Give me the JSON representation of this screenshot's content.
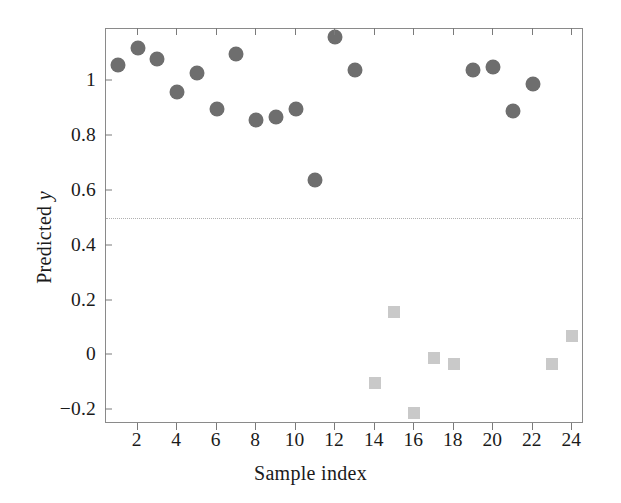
{
  "chart_data": {
    "type": "scatter",
    "title": "",
    "xlabel": "Sample index",
    "ylabel": "Predicted y",
    "xlim": [
      0.4,
      24.6
    ],
    "ylim": [
      -0.25,
      1.19
    ],
    "grid": false,
    "legend": null,
    "x_ticks": [
      2,
      4,
      6,
      8,
      10,
      12,
      14,
      16,
      18,
      20,
      22,
      24
    ],
    "x_tick_labels": [
      "2",
      "4",
      "6",
      "8",
      "10",
      "12",
      "14",
      "16",
      "18",
      "20",
      "22",
      "24"
    ],
    "y_ticks": [
      -0.2,
      0,
      0.2,
      0.4,
      0.6,
      0.8,
      1
    ],
    "y_tick_labels": [
      "−0.2",
      "0",
      "0.2",
      "0.4",
      "0.6",
      "0.8",
      "1"
    ],
    "annotations": [
      {
        "name": "threshold-line",
        "type": "hline",
        "y": 0.5,
        "style": "dotted",
        "color": "#b0b0b0"
      }
    ],
    "series": [
      {
        "name": "class-positive",
        "marker": "circle",
        "color": "#6e6e6e",
        "points": [
          {
            "x": 1,
            "y": 1.06
          },
          {
            "x": 2,
            "y": 1.12
          },
          {
            "x": 3,
            "y": 1.08
          },
          {
            "x": 4,
            "y": 0.96
          },
          {
            "x": 5,
            "y": 1.03
          },
          {
            "x": 6,
            "y": 0.9
          },
          {
            "x": 7,
            "y": 1.1
          },
          {
            "x": 8,
            "y": 0.86
          },
          {
            "x": 9,
            "y": 0.87
          },
          {
            "x": 10,
            "y": 0.9
          },
          {
            "x": 11,
            "y": 0.64
          },
          {
            "x": 12,
            "y": 1.16
          },
          {
            "x": 13,
            "y": 1.04
          },
          {
            "x": 19,
            "y": 1.04
          },
          {
            "x": 20,
            "y": 1.05
          },
          {
            "x": 21,
            "y": 0.89
          },
          {
            "x": 22,
            "y": 0.99
          }
        ]
      },
      {
        "name": "class-negative",
        "marker": "square",
        "color": "#c9c9c9",
        "points": [
          {
            "x": 14,
            "y": -0.1
          },
          {
            "x": 15,
            "y": 0.16
          },
          {
            "x": 16,
            "y": -0.21
          },
          {
            "x": 17,
            "y": -0.01
          },
          {
            "x": 18,
            "y": -0.03
          },
          {
            "x": 23,
            "y": -0.03
          },
          {
            "x": 24,
            "y": 0.07
          }
        ]
      }
    ]
  },
  "axis": {
    "xlabel_text": "Sample index",
    "ylabel_prefix": "Predicted ",
    "ylabel_italic": "y"
  }
}
